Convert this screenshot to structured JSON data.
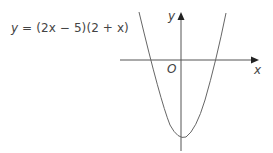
{
  "diagram": {
    "equation": {
      "lhs": "y",
      "equals": " = ",
      "factor1": "(2x − 5)",
      "factor2": "(2 + x)"
    },
    "axes": {
      "x_label": "x",
      "y_label": "y",
      "origin_label": "O"
    },
    "curve": {
      "type": "parabola",
      "function": "y = (2x - 5)(2 + x)",
      "x_intercepts": [
        -2,
        2.5
      ],
      "y_intercept": -10,
      "opens": "up"
    },
    "colors": {
      "line": "#555555",
      "background": "#ffffff"
    }
  }
}
